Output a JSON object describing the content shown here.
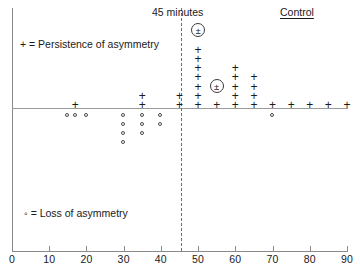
{
  "figure": {
    "divider_label": "45 minutes",
    "control_label": "Control",
    "legend_plus": "+ = Persistence of asymmetry",
    "legend_circle": "◦ = Loss of asymmetry"
  },
  "chart_data": {
    "type": "scatter",
    "title": "",
    "xlabel": "",
    "ylabel": "",
    "xlim": [
      0,
      90
    ],
    "ylim": [
      -5,
      9
    ],
    "grid": false,
    "legend_position": "inside-left",
    "axis_ticks": [
      0,
      10,
      20,
      30,
      40,
      50,
      60,
      70,
      80,
      90
    ],
    "annotations": [
      {
        "name": "divider",
        "text": "45 minutes",
        "x": 45,
        "style": "dashed-vertical"
      },
      {
        "name": "control",
        "text": "Control",
        "x": 77,
        "style": "underlined-label"
      }
    ],
    "legend": [
      {
        "marker": "plus",
        "label": "+ = Persistence of asymmetry"
      },
      {
        "marker": "circle",
        "label": "◦ = Loss of asymmetry"
      }
    ],
    "series": [
      {
        "name": "Persistence of asymmetry",
        "marker": "plus",
        "points": [
          {
            "x": 17,
            "count": 1
          },
          {
            "x": 35,
            "count": 2
          },
          {
            "x": 45,
            "count": 2
          },
          {
            "x": 50,
            "count": 7
          },
          {
            "x": 55,
            "count": 1
          },
          {
            "x": 60,
            "count": 5
          },
          {
            "x": 65,
            "count": 4
          },
          {
            "x": 70,
            "count": 1
          },
          {
            "x": 75,
            "count": 1
          },
          {
            "x": 80,
            "count": 1
          },
          {
            "x": 85,
            "count": 1
          },
          {
            "x": 90,
            "count": 1
          }
        ]
      },
      {
        "name": "Partial (circled plus-minus)",
        "marker": "plusminus-circled",
        "points": [
          {
            "x": 50,
            "level": 8
          },
          {
            "x": 55,
            "level": 2
          }
        ]
      },
      {
        "name": "Loss of asymmetry",
        "marker": "circle",
        "points": [
          {
            "x": 15,
            "count": 1
          },
          {
            "x": 17,
            "count": 1
          },
          {
            "x": 20,
            "count": 1
          },
          {
            "x": 30,
            "count": 4
          },
          {
            "x": 35,
            "count": 3
          },
          {
            "x": 40,
            "count": 2
          },
          {
            "x": 70,
            "count": 1
          }
        ]
      }
    ]
  }
}
